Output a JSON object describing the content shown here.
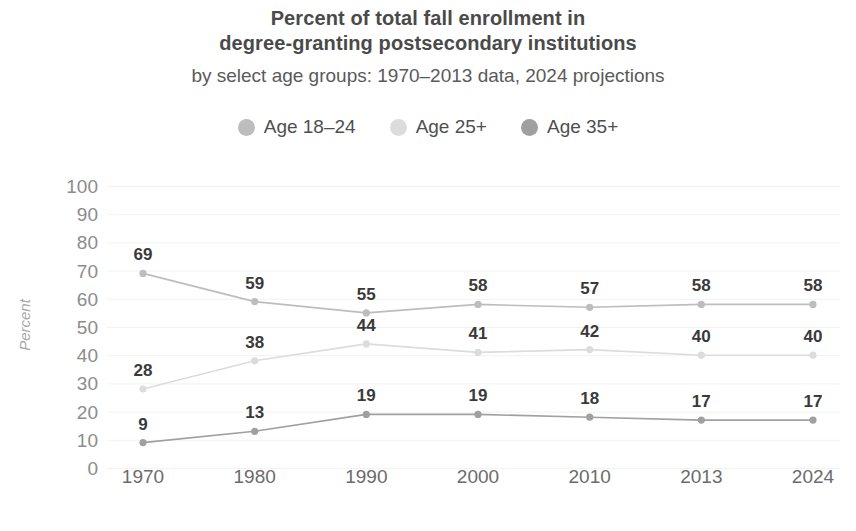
{
  "title": {
    "line1": "Percent of total fall enrollment in",
    "line2": "degree-granting postsecondary institutions"
  },
  "subtitle": "by select age groups: 1970–2013 data, 2024 projections",
  "legend": {
    "position": "top-center",
    "items": [
      {
        "label": "Age 18–24",
        "color": "#bdbdbd",
        "marker": "legend-dot-icon"
      },
      {
        "label": "Age 25+",
        "color": "#dcdcdc",
        "marker": "legend-dot-icon"
      },
      {
        "label": "Age 35+",
        "color": "#a0a0a0",
        "marker": "legend-dot-icon"
      }
    ]
  },
  "axes": {
    "ylabel": "Percent",
    "xlabel": "",
    "yticks": [
      "100",
      "90",
      "80",
      "70",
      "60",
      "50",
      "40",
      "30",
      "20",
      "10",
      "0"
    ],
    "xticks": [
      "1970",
      "1980",
      "1990",
      "2000",
      "2010",
      "2013",
      "2024"
    ],
    "ylim": [
      0,
      100
    ],
    "grid": true,
    "grid_color": "#f2f2f2"
  },
  "source_note": "",
  "chart_data": {
    "type": "line",
    "title": "Percent of total fall enrollment in degree-granting postsecondary institutions",
    "subtitle": "by select age groups: 1970–2013 data, 2024 projections",
    "xlabel": "",
    "ylabel": "Percent",
    "ylim": [
      0,
      100
    ],
    "grid": true,
    "legend": "top-center",
    "categories": [
      "1970",
      "1980",
      "1990",
      "2000",
      "2010",
      "2013",
      "2024"
    ],
    "series": [
      {
        "name": "Age 18–24",
        "color": "#bdbdbd",
        "values": [
          69,
          59,
          55,
          58,
          57,
          58,
          58
        ]
      },
      {
        "name": "Age 25+",
        "color": "#dcdcdc",
        "values": [
          28,
          38,
          44,
          41,
          42,
          40,
          40
        ]
      },
      {
        "name": "Age 35+",
        "color": "#a0a0a0",
        "values": [
          9,
          13,
          19,
          19,
          18,
          17,
          17
        ]
      }
    ]
  }
}
